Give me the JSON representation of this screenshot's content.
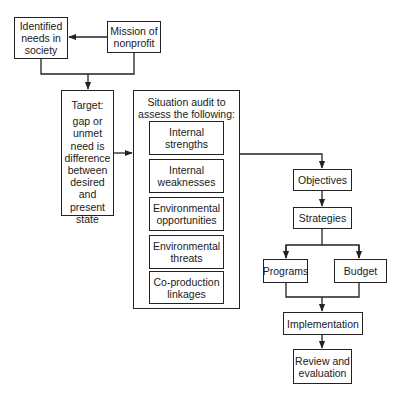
{
  "diagram": {
    "nodes": {
      "needs": {
        "label": "Identified\nneeds in\nsociety"
      },
      "mission": {
        "label": "Mission of\nnonprofit"
      },
      "target": {
        "heading": "Target:",
        "label": "gap or\nunmet\nneed is\ndifference\nbetween\ndesired\nand\npresent\nstate"
      },
      "situation": {
        "heading": "Situation audit to\nassess the following:",
        "items": [
          {
            "label": "Internal\nstrengths"
          },
          {
            "label": "Internal\nweaknesses"
          },
          {
            "label": "Environmental\nopportunities"
          },
          {
            "label": "Environmental\nthreats"
          },
          {
            "label": "Co-production\nlinkages"
          }
        ]
      },
      "objectives": {
        "label": "Objectives"
      },
      "strategies": {
        "label": "Strategies"
      },
      "programs": {
        "label": "Programs"
      },
      "budget": {
        "label": "Budget"
      },
      "implementation": {
        "label": "Implementation"
      },
      "review": {
        "label": "Review and\nevaluation"
      }
    },
    "edges": [
      {
        "from": "mission",
        "to": "needs"
      },
      {
        "from": "needs+mission",
        "to": "target"
      },
      {
        "from": "target",
        "to": "situation"
      },
      {
        "from": "situation",
        "to": "objectives"
      },
      {
        "from": "objectives",
        "to": "strategies"
      },
      {
        "from": "strategies",
        "to": "programs"
      },
      {
        "from": "strategies",
        "to": "budget"
      },
      {
        "from": "programs+budget",
        "to": "implementation"
      },
      {
        "from": "implementation",
        "to": "review"
      }
    ]
  }
}
